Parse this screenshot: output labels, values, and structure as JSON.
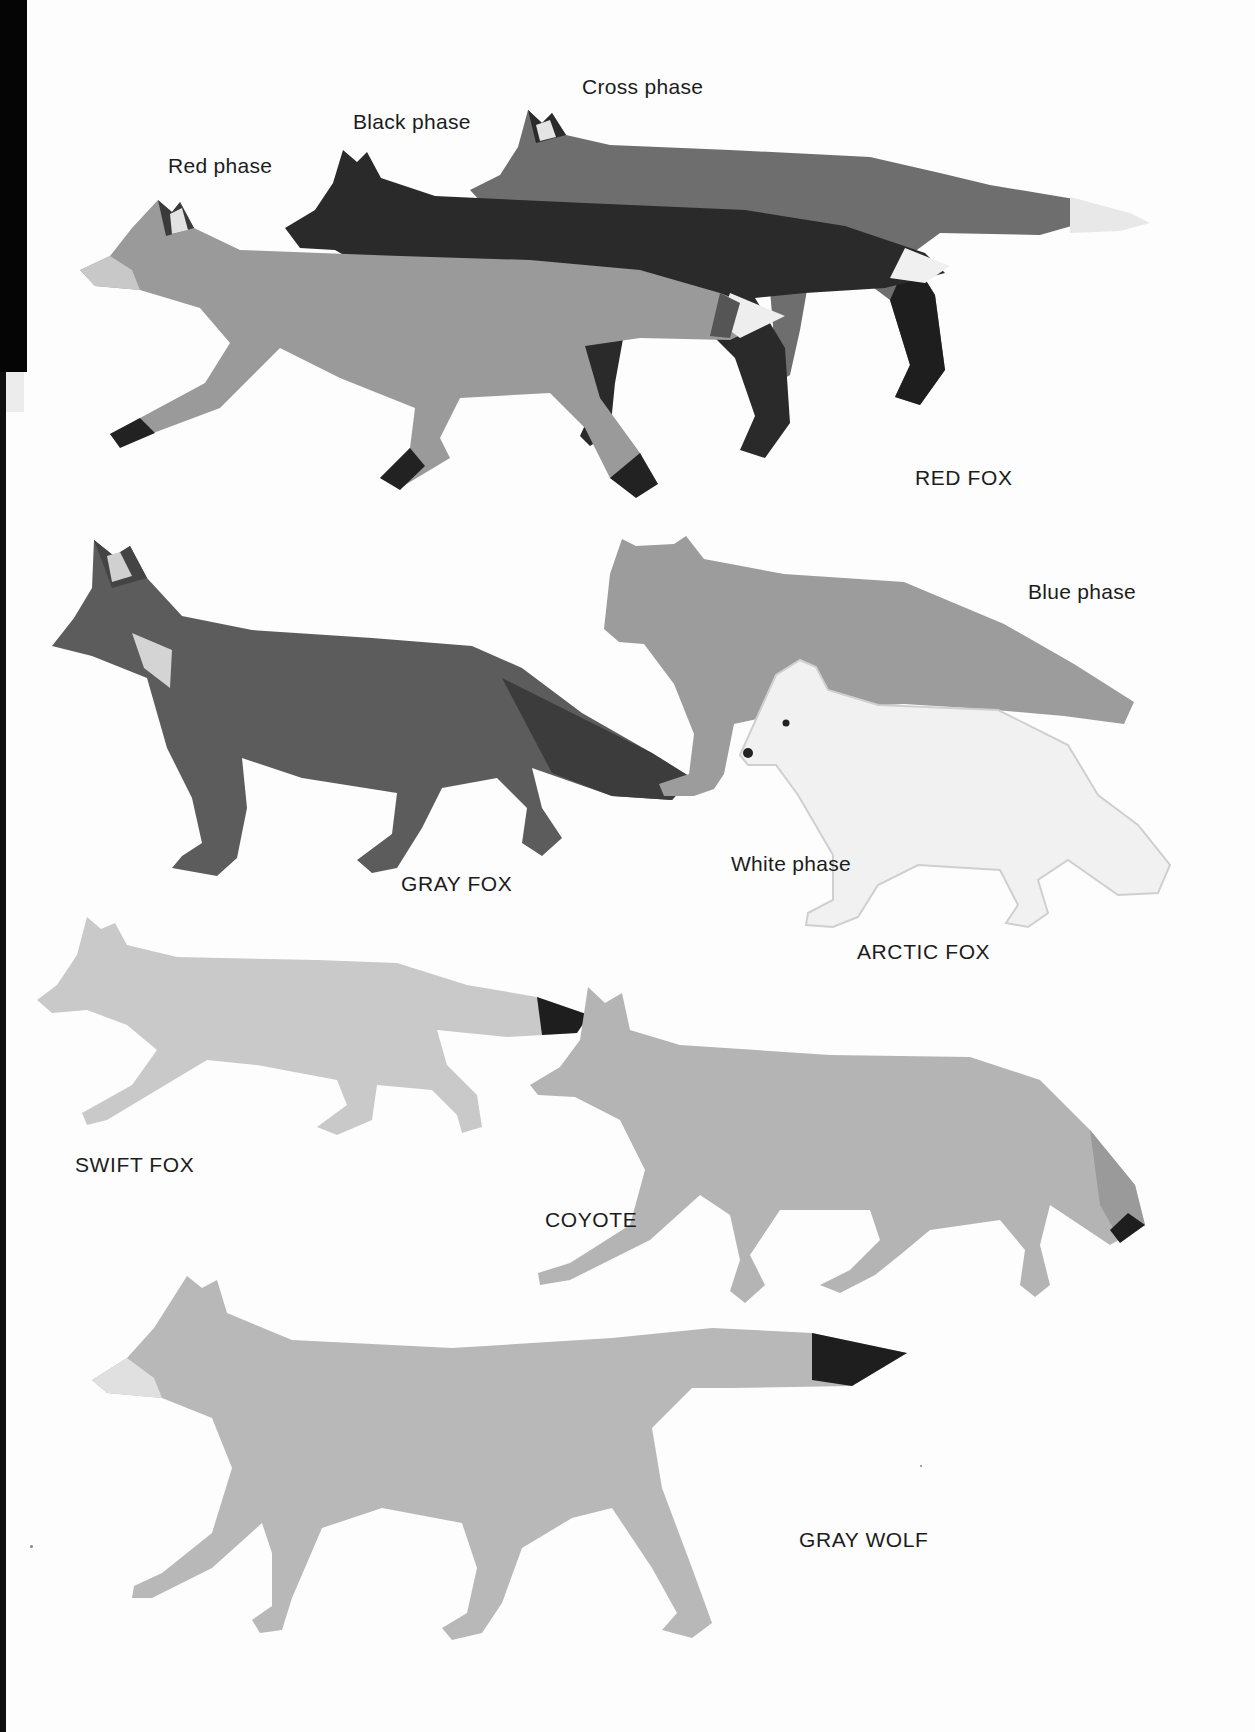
{
  "plate": {
    "page_background": "#fdfdfd",
    "edge_strip_color": "#050505",
    "label_color": "#1c1c1c"
  },
  "groups": [
    {
      "species": "RED FOX",
      "phases": [
        "Red phase",
        "Black phase",
        "Cross phase"
      ]
    },
    {
      "species": "GRAY FOX",
      "phases": []
    },
    {
      "species": "ARCTIC FOX",
      "phases": [
        "Blue phase",
        "White phase"
      ]
    },
    {
      "species": "SWIFT FOX",
      "phases": []
    },
    {
      "species": "COYOTE",
      "phases": []
    },
    {
      "species": "GRAY WOLF",
      "phases": []
    }
  ],
  "illustration_tones": {
    "red_fox_red_phase": "#9a9a9a",
    "red_fox_black_phase": "#2a2a2a",
    "red_fox_cross_phase": "#6e6e6e",
    "gray_fox": "#5c5c5c",
    "arctic_fox_blue_phase": "#9c9c9c",
    "arctic_fox_white_phase": "#f1f1f1",
    "swift_fox": "#c9c9c9",
    "coyote": "#b4b4b4",
    "gray_wolf": "#b8b8b8",
    "dark_accent": "#1e1e1e"
  }
}
